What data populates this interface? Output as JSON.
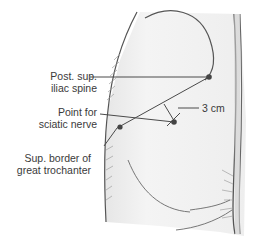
{
  "diagram": {
    "labels": {
      "psis_line1": "Post. sup.",
      "psis_line2": "iliac spine",
      "point_line1": "Point for",
      "point_line2": "sciatic nerve",
      "troch_line1": "Sup. border of",
      "troch_line2": "great trochanter",
      "distance": "3 cm"
    },
    "colors": {
      "line": "#4a4a4a",
      "text": "#3a3a3a",
      "skin": "#f2f2f2",
      "hatch": "#9a9a9a"
    }
  }
}
